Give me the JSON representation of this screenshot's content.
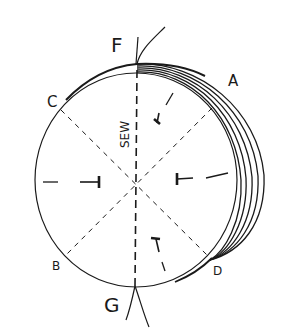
{
  "diagram": {
    "title": "",
    "colors": {
      "ink": "#1a1a1a",
      "background": "#ffffff"
    },
    "labels": {
      "F": "F",
      "G": "G",
      "A": "A",
      "B": "B",
      "C": "C",
      "D": "D",
      "sew": "SEW"
    },
    "elements": {
      "circle": "folded circular fabric",
      "fold_layers": 5,
      "fold_lines": [
        "F-G",
        "C-D",
        "A-B"
      ],
      "pins": 4
    }
  }
}
